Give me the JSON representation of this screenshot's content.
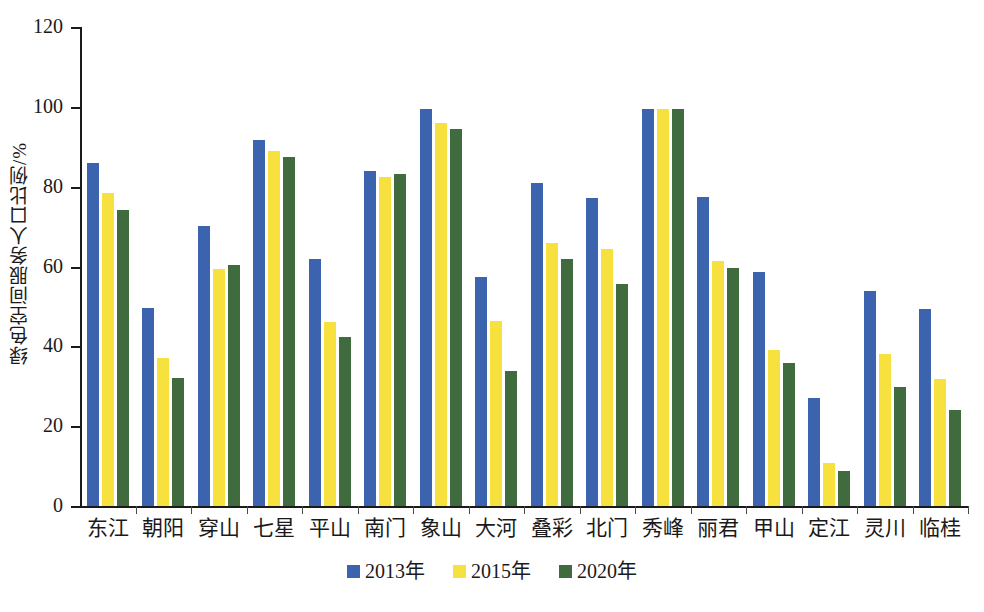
{
  "chart_data": {
    "type": "bar",
    "title": "",
    "xlabel": "",
    "ylabel": "绿色空间服务人口比例/%",
    "ylim": [
      0,
      120
    ],
    "yticks": [
      0,
      20,
      40,
      60,
      80,
      100,
      120
    ],
    "grid": false,
    "legend_position": "bottom-center",
    "categories": [
      "东江",
      "朝阳",
      "穿山",
      "七星",
      "平山",
      "南门",
      "象山",
      "大河",
      "叠彩",
      "北门",
      "秀峰",
      "丽君",
      "甲山",
      "定江",
      "灵川",
      "临桂"
    ],
    "series": [
      {
        "name": "2013年",
        "color": "#3B63AE",
        "values": [
          86.0,
          49.5,
          70.2,
          91.6,
          62.0,
          84.0,
          99.5,
          57.3,
          81.0,
          77.2,
          99.5,
          77.5,
          58.6,
          27.1,
          53.8,
          49.4
        ]
      },
      {
        "name": "2015年",
        "color": "#F7E13F",
        "values": [
          78.4,
          37.0,
          59.4,
          89.0,
          46.0,
          82.4,
          96.0,
          46.3,
          66.0,
          64.3,
          99.5,
          61.4,
          39.2,
          10.7,
          38.2,
          31.9
        ]
      },
      {
        "name": "2020年",
        "color": "#3F6B3F",
        "values": [
          74.2,
          32.1,
          60.4,
          87.4,
          42.4,
          83.3,
          94.5,
          33.9,
          62.0,
          55.7,
          99.5,
          59.7,
          35.9,
          8.7,
          29.7,
          24.0
        ]
      }
    ]
  },
  "axis": {
    "y_tick_labels": [
      "120",
      "100",
      "80",
      "60",
      "40",
      "20",
      "0"
    ]
  },
  "legend": {
    "items": [
      {
        "label": "2013年",
        "color": "#3B63AE"
      },
      {
        "label": "2015年",
        "color": "#F7E13F"
      },
      {
        "label": "2020年",
        "color": "#3F6B3F"
      }
    ]
  }
}
